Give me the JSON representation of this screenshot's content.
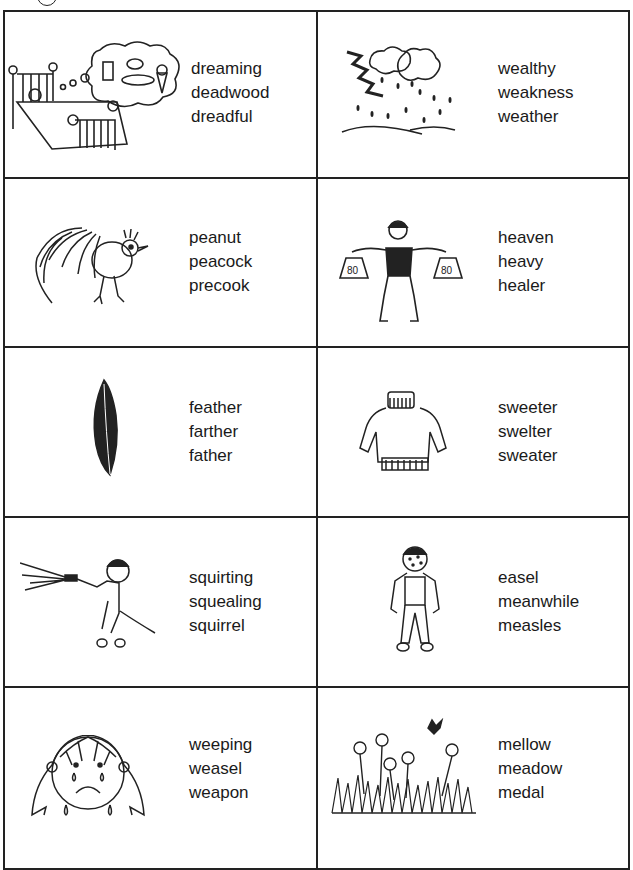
{
  "worksheet": {
    "cells": [
      {
        "picture": "sleeping-child-dreaming-of-food",
        "words": [
          "dreaming",
          "deadwood",
          "dreadful"
        ]
      },
      {
        "picture": "thunderstorm",
        "words": [
          "wealthy",
          "weakness",
          "weather"
        ]
      },
      {
        "picture": "peacock",
        "words": [
          "peanut",
          "peacock",
          "precook"
        ]
      },
      {
        "picture": "strongman-lifting-weights",
        "words": [
          "heaven",
          "heavy",
          "healer"
        ],
        "weight_label": "80"
      },
      {
        "picture": "feather",
        "words": [
          "feather",
          "farther",
          "father"
        ]
      },
      {
        "picture": "sweater",
        "words": [
          "sweeter",
          "swelter",
          "sweater"
        ]
      },
      {
        "picture": "boy-squirting-hose",
        "words": [
          "squirting",
          "squealing",
          "squirrel"
        ]
      },
      {
        "picture": "boy-with-measles",
        "words": [
          "easel",
          "meanwhile",
          "measles"
        ]
      },
      {
        "picture": "crying-girl",
        "words": [
          "weeping",
          "weasel",
          "weapon"
        ]
      },
      {
        "picture": "meadow-flowers",
        "words": [
          "mellow",
          "meadow",
          "medal"
        ]
      }
    ]
  }
}
